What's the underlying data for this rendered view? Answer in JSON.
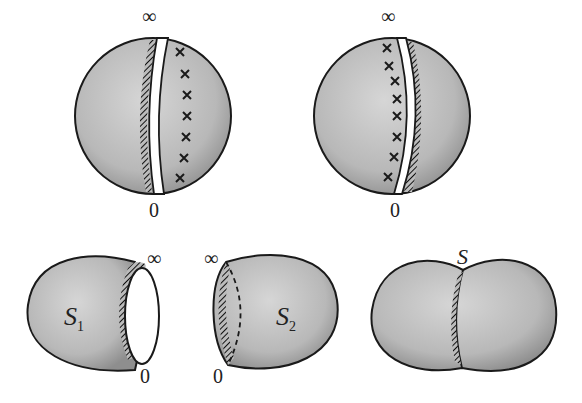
{
  "diagram": {
    "top_left_sphere": {
      "top_label": "∞",
      "bottom_label": "0",
      "marker": "×",
      "marker_count": 7
    },
    "top_right_sphere": {
      "top_label": "∞",
      "bottom_label": "0",
      "marker": "×",
      "marker_count": 8
    },
    "bottom_left_piece": {
      "name": "S",
      "subscript": "1",
      "top_label": "∞",
      "bottom_label": "0"
    },
    "bottom_middle_piece": {
      "name": "S",
      "subscript": "2",
      "top_label": "∞",
      "bottom_label": "0"
    },
    "bottom_right_surface": {
      "label": "S"
    }
  },
  "colors": {
    "fill": "#bdbdbd",
    "stroke": "#1a1a1a",
    "background": "#ffffff"
  }
}
